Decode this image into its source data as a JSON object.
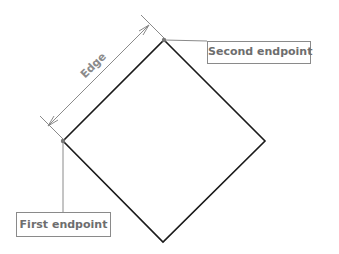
{
  "diagram": {
    "shape": "square rotated 45 degrees",
    "vertices": {
      "top": [
        164,
        40
      ],
      "right": [
        265,
        141
      ],
      "bottom": [
        163,
        242
      ],
      "left": [
        63,
        141
      ]
    },
    "edge_label": "Edge",
    "labels": {
      "first_endpoint": "First endpoint",
      "second_endpoint": "Second endpoint"
    },
    "colors": {
      "shape_stroke": "#1a1a1a",
      "annotation": "#8a8a8a",
      "label_text": "#6e6e6e",
      "endpoint_dot": "#777777"
    }
  }
}
